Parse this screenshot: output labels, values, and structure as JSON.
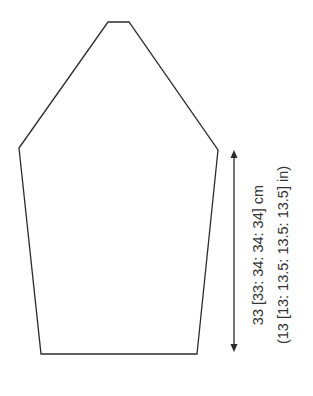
{
  "diagram": {
    "type": "knitting-schematic",
    "piece": "sleeve",
    "outline_color": "#2b2b2b",
    "text_color": "#333333",
    "measurement": {
      "label_cm": "33 [33: 34: 34: 34] cm",
      "label_in": "(13 [13: 13.5: 13.5: 13.5] in)",
      "orientation": "vertical",
      "arrow": "double-headed"
    }
  }
}
